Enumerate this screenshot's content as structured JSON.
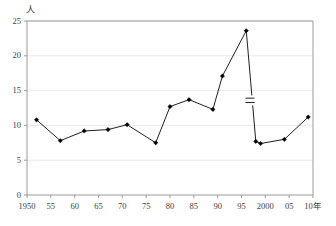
{
  "chart_data": {
    "type": "line",
    "title": "",
    "subtitle": "",
    "xlabel": "10年",
    "ylabel": "人",
    "y_unit": "人",
    "x_unit": "年",
    "grid": true,
    "grid_axis": "y",
    "legend": false,
    "legend_position": "none",
    "xlim": [
      1950,
      2010
    ],
    "ylim": [
      0,
      25
    ],
    "y_ticks": [
      0,
      5,
      10,
      15,
      20,
      25
    ],
    "y_tick_labels": [
      "0",
      "5",
      "10",
      "15",
      "20",
      "25"
    ],
    "x_ticks": [
      1950,
      1955,
      1960,
      1965,
      1970,
      1975,
      1980,
      1985,
      1990,
      1995,
      2000,
      2005,
      2010
    ],
    "x_tick_labels": [
      "1950",
      "55",
      "60",
      "65",
      "70",
      "75",
      "80",
      "85",
      "90",
      "95",
      "2000",
      "05",
      "10年"
    ],
    "marker": "diamond",
    "line_color": "#1f1f1f",
    "marker_color": "#000000",
    "axis_color": "#9a9a9a",
    "grid_color": "#e3e3e3",
    "annotations": [
      {
        "name": "axis-break-marker",
        "x": 1996.8,
        "y": 13.6,
        "label": ""
      }
    ],
    "x": [
      1952,
      1957,
      1962,
      1967,
      1971,
      1977,
      1980,
      1984,
      1989,
      1991,
      1996,
      1998,
      1999,
      2004,
      2009
    ],
    "values": [
      10.8,
      7.8,
      9.2,
      9.4,
      10.1,
      7.5,
      12.7,
      13.7,
      12.3,
      17.1,
      23.6,
      7.7,
      7.4,
      8.0,
      11.2
    ]
  }
}
